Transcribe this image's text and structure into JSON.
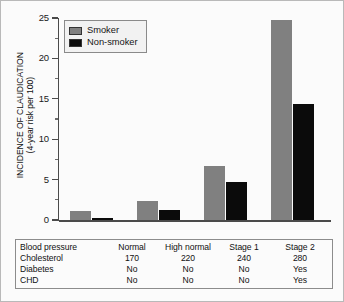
{
  "chart_data": {
    "type": "bar",
    "title": "",
    "subtitle": "",
    "xlabel": "",
    "ylabel": "INCIDENCE OF CLAUDICATION (4-year risk per 100)",
    "ylabel_line1": "INCIDENCE OF CLAUDICATION",
    "ylabel_line2": "(4-year risk per 100)",
    "ylim": [
      0,
      25
    ],
    "ytick_labels": [
      "25",
      "20",
      "15",
      "10",
      "5",
      "0"
    ],
    "ytick_values": [
      25,
      20,
      15,
      10,
      5,
      0
    ],
    "yminor_values": [
      22.5,
      17.5,
      12.5,
      7.5,
      2.5
    ],
    "grid": true,
    "legend_position": "upper-left",
    "categories": [
      "Normal",
      "High normal",
      "Stage 1",
      "Stage 2"
    ],
    "series": [
      {
        "name": "Smoker",
        "color": "#808080",
        "values": [
          1.1,
          2.4,
          6.7,
          24.8
        ]
      },
      {
        "name": "Non-smoker",
        "color": "#0b0b0b",
        "values": [
          0.25,
          1.3,
          4.7,
          14.3
        ]
      }
    ]
  },
  "legend": {
    "items": [
      {
        "label": "Smoker",
        "color": "#808080"
      },
      {
        "label": "Non-smoker",
        "color": "#0b0b0b"
      }
    ]
  },
  "data_table": {
    "rows": [
      {
        "label": "Blood pressure",
        "values": [
          "Normal",
          "High normal",
          "Stage 1",
          "Stage 2"
        ]
      },
      {
        "label": "Cholesterol",
        "values": [
          "170",
          "220",
          "240",
          "280"
        ]
      },
      {
        "label": "Diabetes",
        "values": [
          "No",
          "No",
          "No",
          "Yes"
        ]
      },
      {
        "label": "CHD",
        "values": [
          "No",
          "No",
          "No",
          "Yes"
        ]
      }
    ]
  },
  "colors": {
    "smoker": "#808080",
    "non_smoker": "#0b0b0b",
    "axis": "#4a4a4a",
    "grid": "#ededed",
    "border": "#b9b9b9",
    "background": "#fbfbfb"
  }
}
